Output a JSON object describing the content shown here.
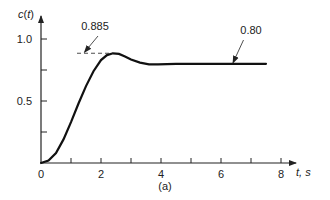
{
  "chart_data": {
    "type": "line",
    "title": "",
    "caption": "(a)",
    "xlabel": "t, s",
    "ylabel": "c(t)",
    "xlim": [
      0,
      8
    ],
    "ylim": [
      0,
      1.0
    ],
    "x_ticks": [
      0,
      1,
      2,
      3,
      4,
      5,
      6,
      7,
      8
    ],
    "x_tick_labels": [
      "0",
      "2",
      "4",
      "6",
      "8"
    ],
    "y_ticks": [
      0.25,
      0.5,
      0.75,
      1.0
    ],
    "y_tick_labels": [
      "0.5",
      "1.0"
    ],
    "grid": false,
    "series": [
      {
        "name": "c(t) step response",
        "x": [
          0,
          0.25,
          0.5,
          0.75,
          1.0,
          1.25,
          1.5,
          1.75,
          2.0,
          2.2,
          2.4,
          2.6,
          2.8,
          3.0,
          3.3,
          3.6,
          3.9,
          4.5,
          5.5,
          6.5,
          7.5
        ],
        "values": [
          0,
          0.02,
          0.08,
          0.19,
          0.33,
          0.48,
          0.62,
          0.74,
          0.83,
          0.87,
          0.885,
          0.88,
          0.86,
          0.835,
          0.81,
          0.795,
          0.795,
          0.8,
          0.8,
          0.8,
          0.8
        ]
      }
    ],
    "annotations": [
      {
        "text": "0.885",
        "target": [
          2.4,
          0.885
        ],
        "note": "peak value, dashed reference line with arrow"
      },
      {
        "text": "0.80",
        "target": [
          6.4,
          0.8
        ],
        "note": "steady-state value with arrow"
      }
    ]
  }
}
